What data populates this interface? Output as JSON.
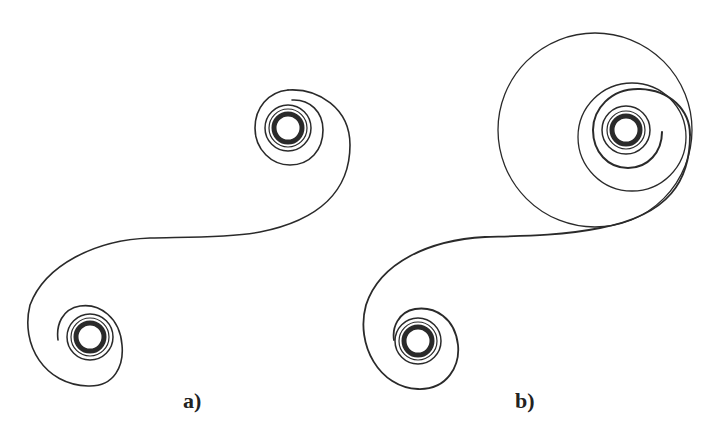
{
  "figure": {
    "panels": [
      {
        "id": "a",
        "label": "a)",
        "description": "S-shaped curve connecting two spiral vortices"
      },
      {
        "id": "b",
        "label": "b)",
        "description": "S-shaped curve connecting two spiral vortices; upper vortex wrapped by enlarged outer loops"
      }
    ],
    "colors": {
      "stroke": "#2a2a2a",
      "background": "#ffffff"
    }
  }
}
